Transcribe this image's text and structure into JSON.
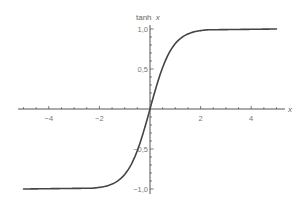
{
  "chart_data": {
    "type": "line",
    "title": "",
    "xlabel": "x",
    "ylabel": "tanh x",
    "xlim": [
      -5.2,
      5.3
    ],
    "ylim": [
      -1.05,
      1.05
    ],
    "x_ticks": [
      -4,
      -2,
      2,
      4
    ],
    "x_tick_labels": [
      "−4",
      "−2",
      "2",
      "4"
    ],
    "y_ticks": [
      1.0,
      0.5,
      -0.5,
      -1.0
    ],
    "y_tick_labels": [
      "1,0",
      "0,5",
      "−0,5",
      "−1,0"
    ],
    "x_minor_tick_step": 0.5,
    "y_minor_tick_step": 0.1,
    "grid": false,
    "legend": null,
    "series": [
      {
        "name": "tanh x",
        "color": "#444444",
        "x": [
          -5.0,
          -3.5,
          -3.0,
          -2.5,
          -2.0,
          -1.5,
          -1.0,
          -0.5,
          0.0,
          0.5,
          1.0,
          1.5,
          2.0,
          2.5,
          3.0,
          3.5,
          5.0
        ],
        "y": [
          -1.0,
          -1.0,
          -0.995,
          -0.987,
          -0.964,
          -0.905,
          -0.762,
          -0.462,
          0.0,
          0.462,
          0.762,
          0.905,
          0.964,
          0.987,
          0.995,
          1.0,
          1.0
        ]
      }
    ]
  },
  "labels": {
    "y_axis_title": "tanh",
    "y_axis_title_var": "x",
    "x_axis_title": "x"
  },
  "colors": {
    "axis": "#555555",
    "curve": "#444444",
    "text": "#777777"
  }
}
